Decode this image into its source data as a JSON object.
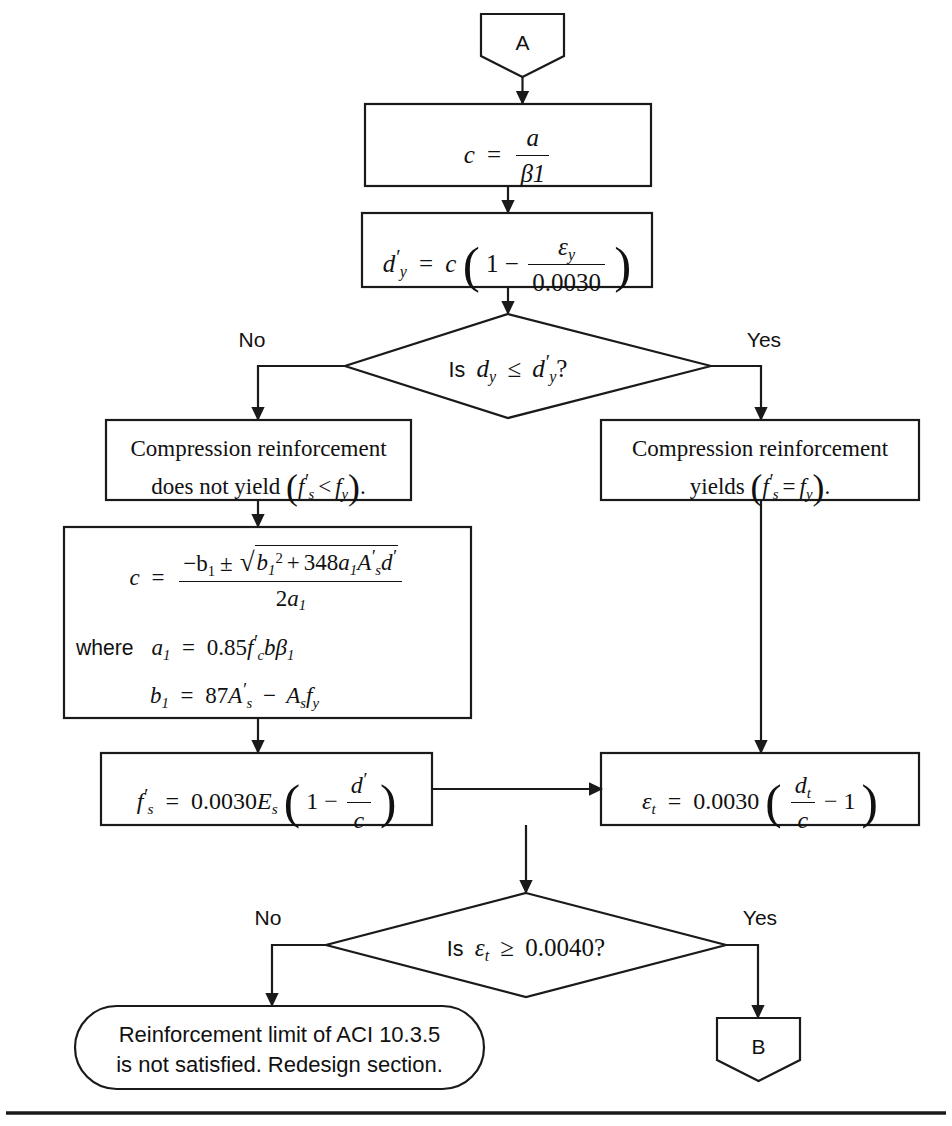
{
  "page": {
    "background_color": "#ffffff",
    "line_color": "#1a1a1a",
    "width": 952,
    "height": 1126
  },
  "connectors": {
    "entry": {
      "label": "A",
      "shape": "pentagon-down"
    },
    "exit": {
      "label": "B",
      "shape": "pentagon-down"
    }
  },
  "nodes": {
    "c_from_a": {
      "type": "process",
      "equation_plain": "c = a / β1",
      "lhs": "c",
      "eq": "=",
      "numerator": "a",
      "denominator": "β1"
    },
    "dy_prime": {
      "type": "process",
      "equation_plain": "d'y = c (1 − εy / 0.0030)",
      "lhs": "d",
      "lhs_sub": "y",
      "eq": "=",
      "coef": "c",
      "inner_lead": "1 −",
      "numerator": "ε",
      "numerator_sub": "y",
      "denominator": "0.0030"
    },
    "decision_dy": {
      "type": "decision",
      "question_plain": "Is dy ≤ d'y ?",
      "prefix": "Is",
      "left_var": "d",
      "left_sub": "y",
      "op": "≤",
      "right_var": "d",
      "right_sub": "y",
      "suffix": "?",
      "branch_no": "No",
      "branch_yes": "Yes"
    },
    "not_yield": {
      "type": "process",
      "line1": "Compression reinforcement",
      "line2_pre": "does not yield",
      "line2_math_lhs": "f",
      "line2_math_lhs_sub": "s",
      "line2_math_op": "<",
      "line2_math_rhs": "f",
      "line2_math_rhs_sub": "y",
      "text_plain": "Compression reinforcement does not yield (f's < fy)."
    },
    "yields": {
      "type": "process",
      "line1": "Compression reinforcement",
      "line2_pre": "yields",
      "line2_math_lhs": "f",
      "line2_math_lhs_sub": "s",
      "line2_math_op": "=",
      "line2_math_rhs": "f",
      "line2_math_rhs_sub": "y",
      "text_plain": "Compression reinforcement yields (f's = fy)."
    },
    "quadratic": {
      "type": "process",
      "equation_plain": "c = ( −b1 ± √(b1² + 348 a1 A's d') ) / (2a1)",
      "lhs": "c",
      "eq": "=",
      "num_lead": "−b",
      "num_lead_sub": "1",
      "pm": "±",
      "rad_b": "b",
      "rad_b_sub": "1",
      "rad_b_sup": "2",
      "rad_plus": "+",
      "rad_coef": "348",
      "rad_a": "a",
      "rad_a_sub": "1",
      "rad_A": "A",
      "rad_A_sub": "s",
      "rad_d": "d",
      "denominator_coef": "2",
      "denominator_var": "a",
      "denominator_sub": "1",
      "where_label": "where",
      "a1_lhs": "a",
      "a1_lhs_sub": "1",
      "a1_eq": "=",
      "a1_rhs_num": "0.85",
      "a1_rhs_f": "f",
      "a1_rhs_f_sub": "c",
      "a1_rhs_b": "b",
      "a1_rhs_beta": "β",
      "a1_rhs_beta_sub": "1",
      "a1_plain": "a1 = 0.85 f'c b β1",
      "b1_lhs": "b",
      "b1_lhs_sub": "1",
      "b1_eq": "=",
      "b1_coef": "87",
      "b1_A": "A",
      "b1_A_sub": "s",
      "b1_minus": "−",
      "b1_A2": "A",
      "b1_A2_sub": "s",
      "b1_f": "f",
      "b1_f_sub": "y",
      "b1_plain": "b1 = 87 A's − As fy"
    },
    "fs_prime": {
      "type": "process",
      "equation_plain": "f's = 0.0030 Es (1 − d'/c)",
      "lhs": "f",
      "lhs_sub": "s",
      "eq": "=",
      "coef": "0.0030",
      "modulus": "E",
      "modulus_sub": "s",
      "inner_lead": "1 −",
      "numerator": "d",
      "denominator": "c"
    },
    "epsilon_t": {
      "type": "process",
      "equation_plain": "εt = 0.0030 (dt/c − 1)",
      "lhs": "ε",
      "lhs_sub": "t",
      "eq": "=",
      "coef": "0.0030",
      "numerator": "d",
      "numerator_sub": "t",
      "denominator": "c",
      "inner_tail": "− 1"
    },
    "decision_epsilon": {
      "type": "decision",
      "question_plain": "Is εt ≥ 0.0040?",
      "prefix": "Is",
      "var": "ε",
      "var_sub": "t",
      "op": "≥",
      "value": "0.0040",
      "suffix": "?",
      "branch_no": "No",
      "branch_yes": "Yes"
    },
    "redesign": {
      "type": "terminator",
      "line1": "Reinforcement limit of ACI 10.3.5",
      "line2": "is not satisfied. Redesign section.",
      "text_plain": "Reinforcement limit of ACI 10.3.5 is not satisfied. Redesign section."
    }
  },
  "footer_rule": {
    "visible": true
  }
}
